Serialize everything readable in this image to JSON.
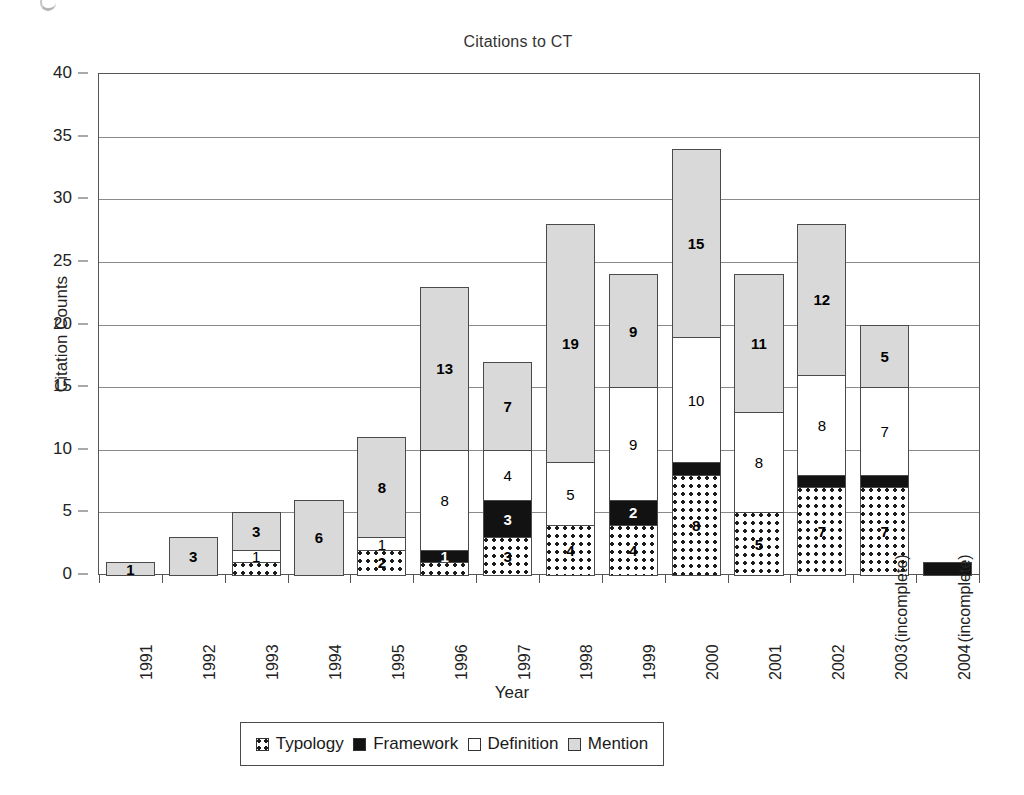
{
  "chart_data": {
    "type": "bar",
    "subtype": "stacked-bar",
    "title": "Citations to CT",
    "xlabel": "Year",
    "ylabel": "Citation Counts",
    "ylim": [
      0,
      40
    ],
    "ytick_step": 5,
    "yticks": [
      0,
      5,
      10,
      15,
      20,
      25,
      30,
      35,
      40
    ],
    "grid": true,
    "legend_position": "bottom",
    "categories": [
      "1991",
      "1992",
      "1993",
      "1994",
      "1995",
      "1996",
      "1997",
      "1998",
      "1999",
      "2000",
      "2001",
      "2002",
      "2003",
      "2004"
    ],
    "category_notes": {
      "2003": "(incomplete)",
      "2004": "(incomplete)"
    },
    "series": [
      {
        "name": "Typology",
        "fill": "dotted",
        "values": [
          0,
          0,
          1,
          0,
          2,
          1,
          3,
          4,
          4,
          8,
          5,
          7,
          7,
          0
        ],
        "labels": [
          "",
          "",
          "",
          "",
          "2",
          "",
          "3",
          "4",
          "4",
          "8",
          "5",
          "7",
          "7",
          ""
        ]
      },
      {
        "name": "Framework",
        "fill": "black",
        "values": [
          0,
          0,
          0,
          0,
          0,
          1,
          3,
          0,
          2,
          1,
          0,
          1,
          1,
          1
        ],
        "labels": [
          "",
          "",
          "",
          "",
          "",
          "1",
          "3",
          "",
          "2",
          "",
          "",
          "",
          "",
          ""
        ]
      },
      {
        "name": "Definition",
        "fill": "white",
        "values": [
          0,
          0,
          1,
          0,
          1,
          8,
          4,
          5,
          9,
          10,
          8,
          8,
          7,
          0
        ],
        "labels": [
          "",
          "",
          "1",
          "",
          "1",
          "8",
          "4",
          "5",
          "9",
          "10",
          "8",
          "8",
          "7",
          ""
        ]
      },
      {
        "name": "Mention",
        "fill": "light-gray",
        "values": [
          1,
          3,
          3,
          6,
          8,
          13,
          7,
          19,
          9,
          15,
          11,
          12,
          5,
          0
        ],
        "labels": [
          "1",
          "3",
          "3",
          "6",
          "8",
          "13",
          "7",
          "19",
          "9",
          "15",
          "11",
          "12",
          "5",
          ""
        ]
      }
    ],
    "totals": [
      1,
      3,
      5,
      6,
      11,
      23,
      17,
      28,
      24,
      34,
      24,
      28,
      20,
      1
    ]
  },
  "legend": {
    "items": [
      {
        "label": "Typology",
        "swatch": "dotted"
      },
      {
        "label": "Framework",
        "swatch": "black"
      },
      {
        "label": "Definition",
        "swatch": "white"
      },
      {
        "label": "Mention",
        "swatch": "light-gray"
      }
    ]
  },
  "colors": {
    "mention": "#d9d9d9",
    "framework": "#121212",
    "definition": "#ffffff",
    "typology_dot": "#1b1b1b",
    "axis": "#555555",
    "grid": "#8a8a8a"
  }
}
